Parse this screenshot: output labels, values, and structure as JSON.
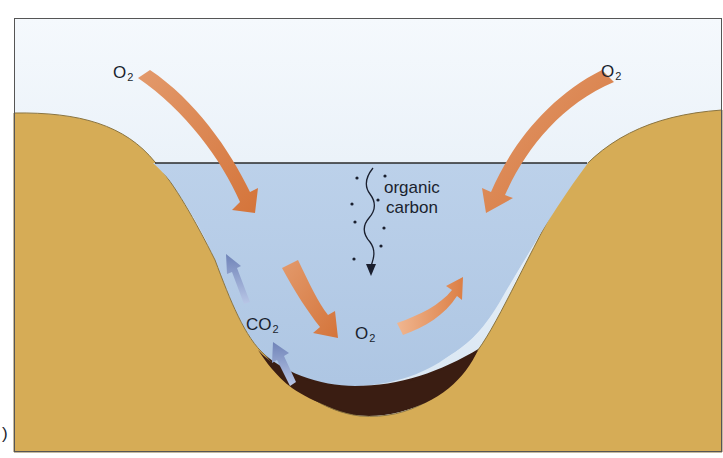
{
  "figure": {
    "panel_marker": ")",
    "colors": {
      "sky_top": "#f4f8fc",
      "sky_bottom": "#d9e6f2",
      "water": "#b4cbe6",
      "land": "#d7ad58",
      "land_edge": "#7a6a3a",
      "sediment": "#3a1d12",
      "o2_arrow": "#d9804a",
      "co2_arrow": "#7f93c4",
      "text": "#1a1f2e",
      "frame": "#555555",
      "waterline": "#2a2a2a"
    },
    "labels": {
      "o2_top_left": {
        "base": "O",
        "sub": "2"
      },
      "o2_top_right": {
        "base": "O",
        "sub": "2"
      },
      "o2_center": {
        "base": "O",
        "sub": "2"
      },
      "co2": {
        "base": "CO",
        "sub": "2"
      },
      "organic_carbon": {
        "line1": "organic",
        "line2": "carbon"
      }
    },
    "arrows": [
      {
        "name": "o2-atmosphere-to-water-left",
        "direction": "down-right",
        "color": "o2_arrow"
      },
      {
        "name": "o2-atmosphere-to-water-right",
        "direction": "down-left",
        "color": "o2_arrow"
      },
      {
        "name": "o2-downward-to-center",
        "direction": "down-right",
        "color": "o2_arrow"
      },
      {
        "name": "o2-center-upward",
        "direction": "up-right",
        "color": "o2_arrow"
      },
      {
        "name": "co2-upper-rising",
        "direction": "up-left",
        "color": "co2_arrow"
      },
      {
        "name": "co2-lower-rising",
        "direction": "up-left",
        "color": "co2_arrow"
      },
      {
        "name": "organic-carbon-sinking",
        "direction": "down",
        "color": "text"
      }
    ]
  }
}
